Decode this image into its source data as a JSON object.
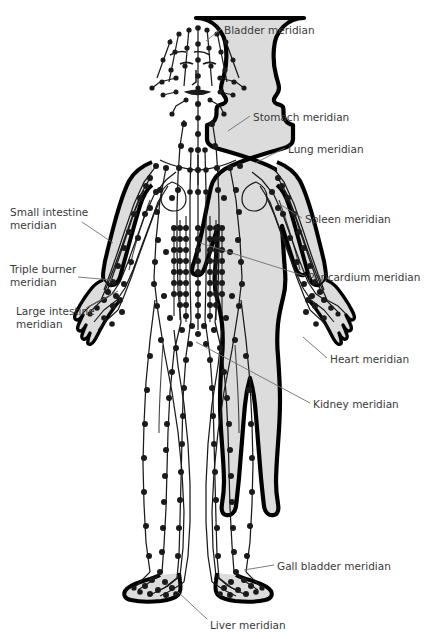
{
  "diagram": {
    "figure_name": "human-body-meridian-chart",
    "view": "front",
    "colors": {
      "background": "#ffffff",
      "body_fill": "#dcdcdc",
      "body_outline": "#000000",
      "meridian_line": "#1a1a1a",
      "acupoint": "#1a1a1a",
      "label_text": "#3a3a3a",
      "leader_line": "#6e6e6e"
    }
  },
  "labels": [
    {
      "id": "bladder",
      "text": "Bladder meridian",
      "side": "right",
      "x": 224,
      "y": 24,
      "align": "left"
    },
    {
      "id": "stomach",
      "text": "Stomach meridian",
      "side": "right",
      "x": 253,
      "y": 111,
      "align": "left"
    },
    {
      "id": "lung",
      "text": "Lung meridian",
      "side": "right",
      "x": 288,
      "y": 143,
      "align": "left"
    },
    {
      "id": "spleen",
      "text": "Spleen meridian",
      "side": "right",
      "x": 305,
      "y": 213,
      "align": "left"
    },
    {
      "id": "pericardium",
      "text": "Pericardium meridian",
      "side": "right",
      "x": 308,
      "y": 271,
      "align": "left"
    },
    {
      "id": "heart",
      "text": "Heart meridian",
      "side": "right",
      "x": 330,
      "y": 353,
      "align": "left"
    },
    {
      "id": "kidney",
      "text": "Kidney meridian",
      "side": "right",
      "x": 313,
      "y": 398,
      "align": "left"
    },
    {
      "id": "gall-bladder",
      "text": "Gall bladder meridian",
      "side": "right",
      "x": 277,
      "y": 560,
      "align": "left"
    },
    {
      "id": "liver",
      "text": "Liver meridian",
      "side": "right",
      "x": 210,
      "y": 619,
      "align": "left"
    },
    {
      "id": "small-intestine",
      "text": "Small intestine\nmeridian",
      "side": "left",
      "x": 10,
      "y": 206,
      "align": "left"
    },
    {
      "id": "triple-burner",
      "text": "Triple burner\nmeridian",
      "side": "left",
      "x": 10,
      "y": 263,
      "align": "left"
    },
    {
      "id": "large-intestine",
      "text": "Large intestine\nmeridian",
      "side": "left",
      "x": 16,
      "y": 305,
      "align": "left"
    }
  ],
  "leaders": [
    {
      "id": "bladder",
      "x1": 221,
      "y1": 29,
      "x2": 206,
      "y2": 41
    },
    {
      "id": "stomach",
      "x1": 250,
      "y1": 116,
      "x2": 228,
      "y2": 131
    },
    {
      "id": "lung",
      "x1": 285,
      "y1": 148,
      "x2": 255,
      "y2": 163
    },
    {
      "id": "spleen",
      "x1": 302,
      "y1": 218,
      "x2": 281,
      "y2": 205
    },
    {
      "id": "pericardium",
      "x1": 305,
      "y1": 276,
      "x2": 200,
      "y2": 243
    },
    {
      "id": "heart",
      "x1": 327,
      "y1": 358,
      "x2": 303,
      "y2": 337
    },
    {
      "id": "kidney",
      "x1": 310,
      "y1": 403,
      "x2": 196,
      "y2": 342
    },
    {
      "id": "gall-bladder",
      "x1": 274,
      "y1": 565,
      "x2": 244,
      "y2": 570
    },
    {
      "id": "liver",
      "x1": 207,
      "y1": 619,
      "x2": 178,
      "y2": 592
    },
    {
      "id": "small-intestine",
      "x1": 82,
      "y1": 222,
      "x2": 113,
      "y2": 243
    },
    {
      "id": "triple-burner",
      "x1": 78,
      "y1": 277,
      "x2": 112,
      "y2": 280
    },
    {
      "id": "large-intestine",
      "x1": 86,
      "y1": 308,
      "x2": 118,
      "y2": 291
    }
  ],
  "meridian_names": [
    "Bladder meridian",
    "Stomach meridian",
    "Lung meridian",
    "Spleen meridian",
    "Pericardium meridian",
    "Heart meridian",
    "Kidney meridian",
    "Gall bladder meridian",
    "Liver meridian",
    "Small intestine meridian",
    "Triple burner meridian",
    "Large intestine meridian"
  ]
}
